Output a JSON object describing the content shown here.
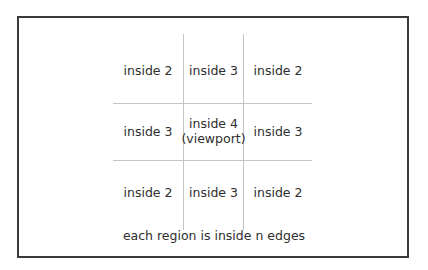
{
  "diagram": {
    "type": "grid-regions",
    "rows": [
      [
        {
          "label": "inside 2"
        },
        {
          "label": "inside 3"
        },
        {
          "label": "inside 2"
        }
      ],
      [
        {
          "label": "inside 3"
        },
        {
          "label": "inside 4",
          "sublabel": "(viewport)"
        },
        {
          "label": "inside 3"
        }
      ],
      [
        {
          "label": "inside 2"
        },
        {
          "label": "inside 3"
        },
        {
          "label": "inside 2"
        }
      ]
    ],
    "caption": "each region is inside n edges",
    "colors": {
      "frame": "#3a3a3a",
      "grid_lines": "#c4c4c4",
      "text": "#2e2e2e",
      "background": "#ffffff"
    }
  }
}
